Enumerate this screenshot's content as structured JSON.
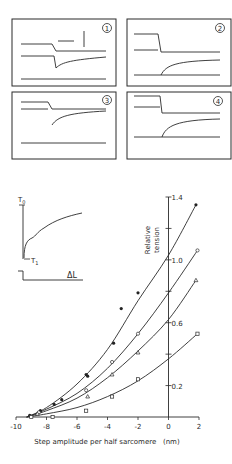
{
  "panels": [
    {
      "label": "1"
    },
    {
      "label": "2"
    },
    {
      "label": "3"
    },
    {
      "label": "4"
    }
  ],
  "inset": {
    "t0_label": "T",
    "t0_sub": "0",
    "t1_label": "T",
    "t1_sub": "1",
    "dl_label": "ΔL"
  },
  "chart_data": {
    "type": "scatter",
    "title": "",
    "xlabel": "Step amplitude per half sarcomere   (nm)",
    "ylabel": "Relative tension",
    "ylabel_lines": [
      "Relative",
      "tension"
    ],
    "xlim": [
      -10,
      2
    ],
    "ylim": [
      0,
      1.4
    ],
    "x_ticks": [
      -10,
      -8,
      -6,
      -4,
      -2,
      0,
      2
    ],
    "x_tick_labels": [
      "-10",
      "-8",
      "-6",
      "-4",
      "-2",
      "0",
      "2"
    ],
    "y_ticks": [
      0.2,
      0.4,
      0.6,
      0.8,
      1.0,
      1.2,
      1.4
    ],
    "y_tick_labels": [
      "0.2",
      "",
      "0.6",
      "",
      "1.0",
      "",
      "1.4"
    ],
    "grid": false,
    "series": [
      {
        "name": "filled-circle",
        "marker": "filled-circle",
        "points": [
          [
            -9.1,
            0.01
          ],
          [
            -8.4,
            0.04
          ],
          [
            -7.5,
            0.08
          ],
          [
            -7.0,
            0.11
          ],
          [
            -5.4,
            0.27
          ],
          [
            -5.3,
            0.26
          ],
          [
            -3.6,
            0.47
          ],
          [
            -3.1,
            0.69
          ],
          [
            -2.0,
            0.79
          ],
          [
            1.8,
            1.35
          ]
        ],
        "curve": [
          [
            -9.3,
            0.0
          ],
          [
            -8,
            0.06
          ],
          [
            -6,
            0.21
          ],
          [
            -4,
            0.43
          ],
          [
            -2,
            0.74
          ],
          [
            0,
            1.03
          ],
          [
            1.8,
            1.35
          ]
        ]
      },
      {
        "name": "open-circle",
        "marker": "open-circle",
        "points": [
          [
            -8.5,
            0.03
          ],
          [
            -5.4,
            0.17
          ],
          [
            -3.7,
            0.35
          ],
          [
            -2.0,
            0.53
          ],
          [
            1.9,
            1.06
          ]
        ],
        "curve": [
          [
            -9.3,
            0.0
          ],
          [
            -8,
            0.05
          ],
          [
            -6,
            0.15
          ],
          [
            -4,
            0.31
          ],
          [
            -2,
            0.53
          ],
          [
            0,
            0.79
          ],
          [
            1.9,
            1.06
          ]
        ]
      },
      {
        "name": "triangle",
        "marker": "triangle",
        "points": [
          [
            -8.6,
            0.02
          ],
          [
            -5.3,
            0.13
          ],
          [
            -3.7,
            0.27
          ],
          [
            -2.0,
            0.41
          ],
          [
            1.8,
            0.87
          ]
        ],
        "curve": [
          [
            -9.3,
            0.0
          ],
          [
            -8,
            0.04
          ],
          [
            -6,
            0.12
          ],
          [
            -4,
            0.25
          ],
          [
            -2,
            0.42
          ],
          [
            0,
            0.62
          ],
          [
            1.8,
            0.87
          ]
        ]
      },
      {
        "name": "square",
        "marker": "square",
        "points": [
          [
            -9.0,
            0.0
          ],
          [
            -7.6,
            0.0
          ],
          [
            -5.4,
            0.04
          ],
          [
            -3.7,
            0.13
          ],
          [
            -2.0,
            0.24
          ],
          [
            1.9,
            0.53
          ]
        ],
        "curve": [
          [
            -9.3,
            0.0
          ],
          [
            -8,
            0.02
          ],
          [
            -6,
            0.06
          ],
          [
            -4,
            0.13
          ],
          [
            -2,
            0.23
          ],
          [
            0,
            0.37
          ],
          [
            1.9,
            0.53
          ]
        ]
      }
    ]
  }
}
